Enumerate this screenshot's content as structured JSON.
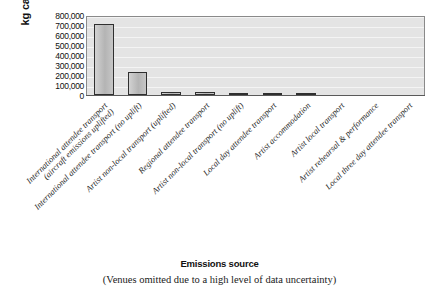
{
  "chart_data": {
    "type": "bar",
    "title": "",
    "xlabel": "Emissions source",
    "ylabel": "kg carbon dioxide",
    "ylim": [
      0,
      800000
    ],
    "ytick_labels": [
      "800,000",
      "700,000",
      "600,000",
      "500,000",
      "400,000",
      "300,000",
      "200,000",
      "100,000",
      "0"
    ],
    "ytick_values": [
      800000,
      700000,
      600000,
      500000,
      400000,
      300000,
      200000,
      100000,
      0
    ],
    "grid": true,
    "legend": "none",
    "caption": "(Venues omitted due to a high level of data uncertainty)",
    "categories": [
      "International attendee transport (aircraft emissions uplifted)",
      "International attendee transport (no uplift)",
      "Artist non-local transport (uplifted)",
      "Regional attendee transport",
      "Artist non-local transport (no uplift)",
      "Local day attendee transport",
      "Artist accommodation",
      "Artist local transport",
      "Artist rehearsal & performance",
      "Local three day attendee transport"
    ],
    "category_lines": [
      [
        "International attendee transport",
        "(aircraft emissions uplifted)"
      ],
      [
        "International attendee transport (no uplift)",
        ""
      ],
      [
        "Artist non-local transport (uplifted)",
        ""
      ],
      [
        "Regional attendee transport",
        ""
      ],
      [
        "Artist non-local transport (no uplift)",
        ""
      ],
      [
        "Local day attendee transport",
        ""
      ],
      [
        "Artist accommodation",
        ""
      ],
      [
        "Artist local transport",
        ""
      ],
      [
        "Artist rehearsal & performance",
        ""
      ],
      [
        "Local three day attendee transport",
        ""
      ]
    ],
    "values": [
      710000,
      230000,
      35000,
      30000,
      25000,
      14000,
      9000,
      2000,
      1000,
      500
    ],
    "colors": {
      "bar_fill": "#bcbcbc",
      "bar_edge": "#2f2f2f",
      "plot_background": "#e4e4e4",
      "gridline": "#f4f4f4",
      "text": "#111111"
    }
  }
}
